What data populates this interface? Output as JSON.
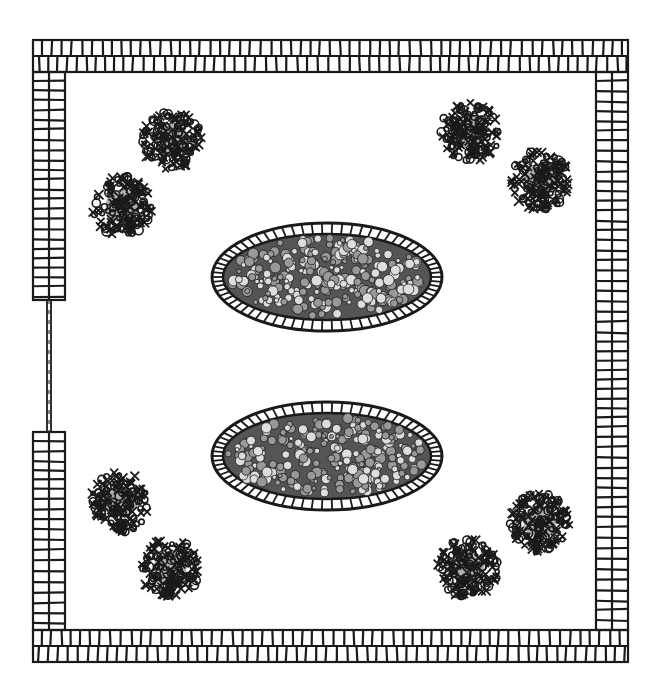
{
  "colors": {
    "ink": "#1a1a1a",
    "paper": "#ffffff"
  },
  "wall": {
    "outer": [
      33,
      40,
      628,
      662
    ],
    "thickness": 32,
    "gate": {
      "side": "left",
      "y_start": 300,
      "y_end": 432
    }
  },
  "beds": [
    {
      "name": "upper-flower-bed",
      "cx": 327,
      "cy": 277,
      "rx": 115,
      "ry": 54
    },
    {
      "name": "lower-flower-bed",
      "cx": 327,
      "cy": 456,
      "rx": 115,
      "ry": 54
    }
  ],
  "shrubs": [
    {
      "name": "shrub-top-left-1",
      "cx": 172,
      "cy": 140,
      "r": 30
    },
    {
      "name": "shrub-top-left-2",
      "cx": 122,
      "cy": 206,
      "r": 30
    },
    {
      "name": "shrub-top-right-1",
      "cx": 470,
      "cy": 132,
      "r": 30
    },
    {
      "name": "shrub-top-right-2",
      "cx": 540,
      "cy": 180,
      "r": 30
    },
    {
      "name": "shrub-bottom-left-1",
      "cx": 120,
      "cy": 502,
      "r": 30
    },
    {
      "name": "shrub-bottom-left-2",
      "cx": 170,
      "cy": 568,
      "r": 30
    },
    {
      "name": "shrub-bottom-right-1",
      "cx": 540,
      "cy": 522,
      "r": 30
    },
    {
      "name": "shrub-bottom-right-2",
      "cx": 468,
      "cy": 568,
      "r": 30
    }
  ]
}
